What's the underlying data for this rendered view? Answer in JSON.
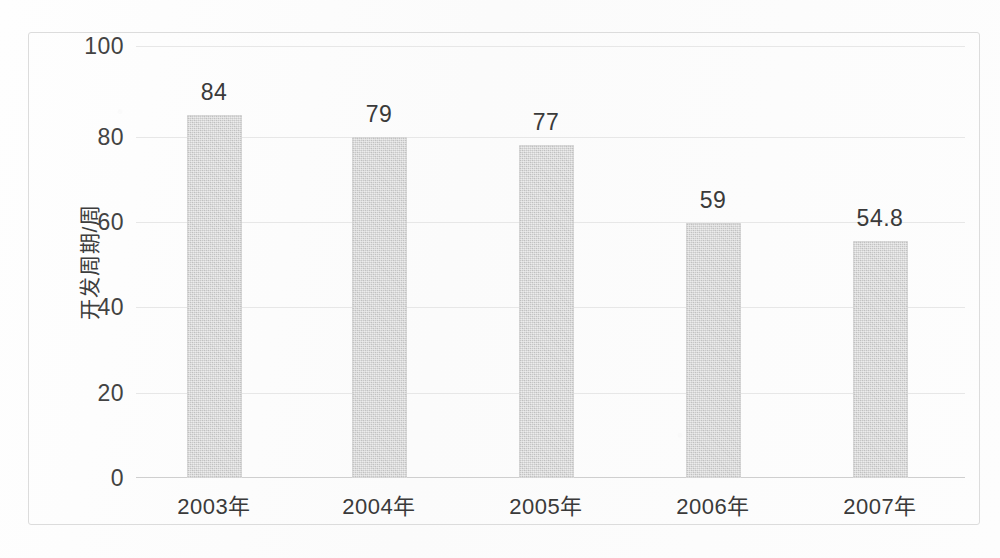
{
  "chart_data": {
    "type": "bar",
    "title": "",
    "subtitle": "",
    "xlabel": "",
    "ylabel": "开发周期/周",
    "categories": [
      "2003年",
      "2004年",
      "2005年",
      "2006年",
      "2007年"
    ],
    "values": [
      84,
      79,
      77,
      59,
      54.8
    ],
    "value_labels": [
      "84",
      "79",
      "77",
      "59",
      "54.8"
    ],
    "series": [
      {
        "name": "开发周期/周",
        "values": [
          84,
          79,
          77,
          59,
          54.8
        ]
      }
    ],
    "ylim": [
      0,
      100
    ],
    "xlim_categories": 5,
    "yticks": [
      0,
      20,
      40,
      60,
      80,
      100
    ],
    "ytick_labels": [
      "0",
      "20",
      "40",
      "60",
      "80",
      "100"
    ],
    "grid": true,
    "grid_axis": "y",
    "legend": false,
    "legend_position": "none",
    "bar_color": "#c9c9c9",
    "grid_color": "#e7e7e7",
    "axis_color": "#cfcfcf",
    "text_color": "#3a3a3a",
    "frame_color": "#dcdcdc",
    "background_color": "#fdfdfd",
    "data_labels_shown": true,
    "annotations": []
  }
}
